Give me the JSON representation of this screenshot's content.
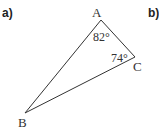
{
  "parts": {
    "a": "a)",
    "b": "b)"
  },
  "triangle": {
    "vertices": {
      "A": "A",
      "B": "B",
      "C": "C"
    },
    "angles": {
      "A": "82°",
      "C": "74°"
    },
    "stroke": "#333333"
  }
}
